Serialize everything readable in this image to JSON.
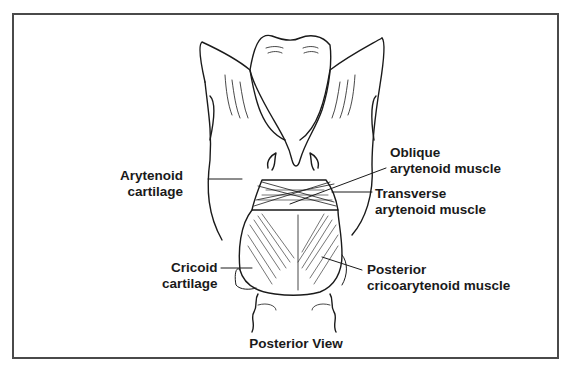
{
  "figure": {
    "view_title": "Posterior View",
    "labels": {
      "arytenoid_cartilage": {
        "line1": "Arytenoid",
        "line2": "cartilage"
      },
      "cricoid_cartilage": {
        "line1": "Cricoid",
        "line2": "cartilage"
      },
      "oblique_arytenoid": {
        "line1": "Oblique",
        "line2": "arytenoid muscle"
      },
      "transverse_arytenoid": {
        "line1": "Transverse",
        "line2": "arytenoid muscle"
      },
      "posterior_cricoarytenoid": {
        "line1": "Posterior",
        "line2": "cricoarytenoid muscle"
      }
    },
    "colors": {
      "ink": "#1a1a1a",
      "frame": "#4a4a4a",
      "background": "#ffffff"
    }
  }
}
